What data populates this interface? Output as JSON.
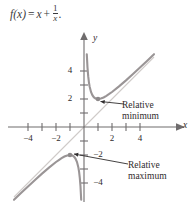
{
  "figure": {
    "formula": {
      "lhs": "f(x)",
      "equals": "=",
      "term1": "x",
      "plus": "+",
      "frac_num": "1",
      "frac_den": "x",
      "period": "."
    },
    "axis": {
      "x_label": "x",
      "y_label": "y",
      "x_ticks": [
        {
          "value": -4,
          "label": "−4"
        },
        {
          "value": -3,
          "label": ""
        },
        {
          "value": -2,
          "label": "−2"
        },
        {
          "value": -1,
          "label": ""
        },
        {
          "value": 1,
          "label": ""
        },
        {
          "value": 2,
          "label": "2"
        },
        {
          "value": 3,
          "label": ""
        },
        {
          "value": 4,
          "label": "4"
        }
      ],
      "y_ticks": [
        {
          "value": 4,
          "label": "4"
        },
        {
          "value": 3,
          "label": ""
        },
        {
          "value": 2,
          "label": "2"
        },
        {
          "value": 1,
          "label": ""
        },
        {
          "value": -1,
          "label": ""
        },
        {
          "value": -2,
          "label": "−2"
        },
        {
          "value": -3,
          "label": ""
        },
        {
          "value": -4,
          "label": "−4"
        }
      ]
    },
    "annotations": [
      {
        "name": "relative-minimum",
        "line1": "Relative",
        "line2": "minimum",
        "point": [
          1,
          2
        ]
      },
      {
        "name": "relative-maximum",
        "line1": "Relative",
        "line2": "maximum",
        "point": [
          -1,
          -2
        ]
      }
    ],
    "colors": {
      "curve": "#9a9596",
      "asymptote": "#cfcbc9",
      "axis": "#6f6c6d",
      "text": "#2f2c2d",
      "point": "#8e8a8b"
    }
  },
  "chart_data": {
    "type": "line",
    "title": "",
    "xlabel": "x",
    "ylabel": "y",
    "xlim": [
      -5.0,
      5.2
    ],
    "ylim": [
      -5.0,
      5.2
    ],
    "grid": false,
    "legend": "none",
    "series": [
      {
        "name": "f(x) = x + 1/x  (branch x > 0)",
        "x": [
          0.2,
          0.25,
          0.3,
          0.35,
          0.4,
          0.5,
          0.6,
          0.7,
          0.8,
          0.9,
          1.0,
          1.2,
          1.4,
          1.6,
          1.8,
          2.0,
          2.5,
          3.0,
          3.5,
          4.0,
          4.5,
          5.0
        ],
        "y": [
          5.2,
          4.25,
          3.63,
          3.21,
          2.9,
          2.5,
          2.27,
          2.13,
          2.05,
          2.01,
          2.0,
          2.03,
          2.11,
          2.23,
          2.36,
          2.5,
          2.9,
          3.33,
          3.79,
          4.25,
          4.72,
          5.2
        ]
      },
      {
        "name": "f(x) = x + 1/x  (branch x < 0)",
        "x": [
          -5.0,
          -4.5,
          -4.0,
          -3.5,
          -3.0,
          -2.5,
          -2.0,
          -1.8,
          -1.6,
          -1.4,
          -1.2,
          -1.0,
          -0.9,
          -0.8,
          -0.7,
          -0.6,
          -0.5,
          -0.4,
          -0.35,
          -0.3,
          -0.25,
          -0.2
        ],
        "y": [
          -5.2,
          -4.72,
          -4.25,
          -3.79,
          -3.33,
          -2.9,
          -2.5,
          -2.36,
          -2.23,
          -2.11,
          -2.03,
          -2.0,
          -2.01,
          -2.05,
          -2.13,
          -2.27,
          -2.5,
          -2.9,
          -3.21,
          -3.63,
          -4.25,
          -5.2
        ]
      },
      {
        "name": "slant asymptote y = x",
        "x": [
          -5.0,
          5.0
        ],
        "y": [
          -5.0,
          5.0
        ]
      }
    ],
    "points": [
      {
        "label": "Relative minimum",
        "x": 1,
        "y": 2
      },
      {
        "label": "Relative maximum",
        "x": -1,
        "y": -2
      }
    ]
  }
}
